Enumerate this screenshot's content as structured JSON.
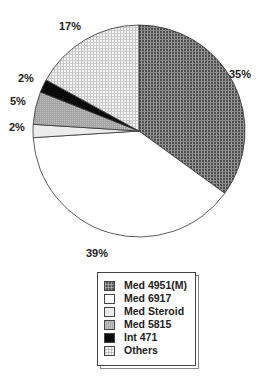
{
  "chart_data": {
    "type": "pie",
    "title": "",
    "categories": [
      "Med 4951(M)",
      "Med 6917",
      "Med Steroid",
      "Med 5815",
      "Int 471",
      "Others"
    ],
    "values": [
      35,
      39,
      2,
      5,
      2,
      17
    ],
    "unit": "%",
    "start_angle_deg": 0,
    "direction": "clockwise",
    "legend_position": "bottom",
    "fills": [
      "#5a5a5a",
      "#ffffff",
      "#ececec",
      "#a9a9a9",
      "#0a0a0a",
      "#f2f2f2"
    ],
    "patterns": [
      "dark-grid",
      "solid",
      "solid",
      "fine-hatch",
      "solid",
      "light-grid"
    ]
  },
  "labels": {
    "s0": "35%",
    "s1": "39%",
    "s2": "2%",
    "s3": "5%",
    "s4": "2%",
    "s5": "17%"
  },
  "legend": {
    "items": [
      {
        "label": "Med 4951(M)"
      },
      {
        "label": "Med 6917"
      },
      {
        "label": "Med Steroid"
      },
      {
        "label": "Med 5815"
      },
      {
        "label": "Int 471"
      },
      {
        "label": "Others"
      }
    ]
  }
}
